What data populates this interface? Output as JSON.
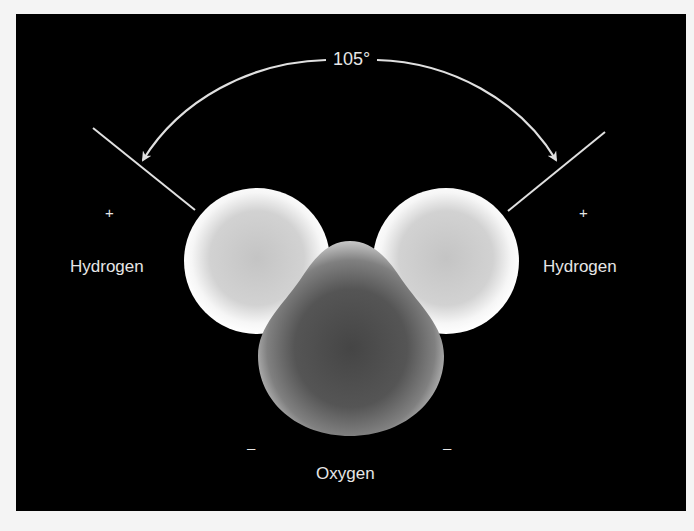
{
  "diagram": {
    "angle_label": "105°",
    "atoms": [
      {
        "id": "hydrogen-left",
        "label": "Hydrogen",
        "charge": "+"
      },
      {
        "id": "hydrogen-right",
        "label": "Hydrogen",
        "charge": "+"
      },
      {
        "id": "oxygen",
        "label": "Oxygen",
        "charges": [
          "–",
          "–"
        ]
      }
    ],
    "colors": {
      "background": "#000000",
      "page": "#f4f4f4",
      "text": "#e6e6e6",
      "hydrogen_rim": "#ffffff",
      "hydrogen_core": "#c8c8c8",
      "oxygen_core": "#4a4a4a",
      "oxygen_rim": "#bdbdbd",
      "lines": "#e0e0e0"
    }
  }
}
